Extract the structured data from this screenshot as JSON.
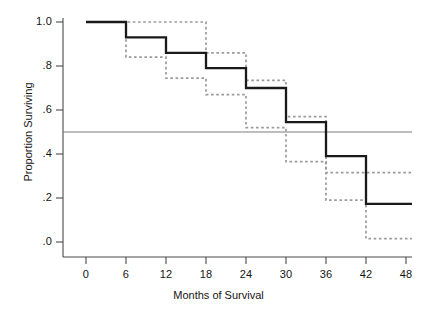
{
  "chart_data": {
    "type": "line",
    "title": "",
    "xlabel": "Months of Survival",
    "ylabel": "Proportion Surviving",
    "xlim": [
      0,
      48
    ],
    "ylim": [
      0.0,
      1.0
    ],
    "grid": false,
    "legend": null,
    "xticks": [
      0,
      6,
      12,
      18,
      24,
      30,
      36,
      42,
      48
    ],
    "xtick_labels": [
      "0",
      "6",
      "12",
      "18",
      "24",
      "30",
      "36",
      "42",
      "48"
    ],
    "yticks": [
      0.0,
      0.2,
      0.4,
      0.6,
      0.8,
      1.0
    ],
    "ytick_labels": [
      ".0",
      ".2",
      ".4",
      ".6",
      ".8",
      "1.0"
    ],
    "series": [
      {
        "name": "Kaplan-Meier survival estimate",
        "style": "solid",
        "color": "#1a1a1a",
        "step": "post",
        "x": [
          0,
          6,
          12,
          18,
          24,
          30,
          36,
          42,
          48
        ],
        "values": [
          1.0,
          0.93,
          0.86,
          0.79,
          0.7,
          0.545,
          0.39,
          0.173,
          0.173
        ]
      },
      {
        "name": "Upper 95% confidence limit",
        "style": "dotted",
        "color": "#9a9a9a",
        "step": "post",
        "x": [
          0,
          6,
          12,
          18,
          24,
          30,
          36,
          42,
          48
        ],
        "values": [
          1.0,
          1.0,
          1.0,
          0.86,
          0.735,
          0.57,
          0.315,
          0.315,
          0.315
        ]
      },
      {
        "name": "Lower 95% confidence limit",
        "style": "dotted",
        "color": "#9a9a9a",
        "step": "post",
        "x": [
          0,
          6,
          12,
          18,
          24,
          30,
          36,
          42,
          48
        ],
        "values": [
          1.0,
          0.84,
          0.745,
          0.67,
          0.52,
          0.365,
          0.19,
          0.015,
          0.015
        ]
      }
    ],
    "reference_lines": [
      {
        "name": "median-survival-reference",
        "orientation": "horizontal",
        "value": 0.5,
        "color": "#7d7d7d"
      }
    ]
  },
  "axes": {
    "x_title": "Months of Survival",
    "y_title": "Proportion Surviving",
    "x_tick_labels": [
      "0",
      "6",
      "12",
      "18",
      "24",
      "30",
      "36",
      "42",
      "48"
    ],
    "y_tick_labels": [
      "1.0",
      ".8",
      ".6",
      ".4",
      ".2",
      ".0"
    ]
  }
}
